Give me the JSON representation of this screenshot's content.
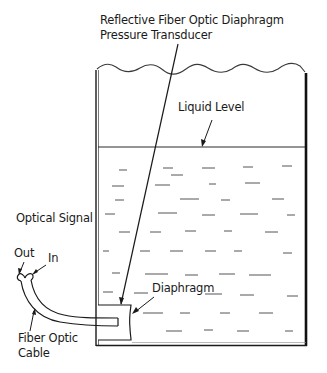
{
  "diagram": {
    "labels": {
      "transducer": {
        "line1": "Reflective Fiber Optic Diaphragm",
        "line2": "Pressure Transducer"
      },
      "liquid_level": "Liquid Level",
      "optical_signal": "Optical Signal",
      "out": "Out",
      "in": "In",
      "diaphragm": "Diaphragm",
      "cable": {
        "line1": "Fiber Optic",
        "line2": "Cable"
      }
    },
    "colors": {
      "line": "#1a1a1a",
      "dash": "#555555",
      "background": "#ffffff"
    }
  }
}
